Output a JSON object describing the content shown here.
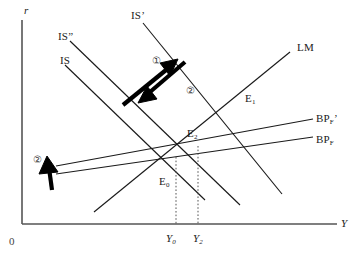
{
  "figure": {
    "type": "economics-diagram",
    "model": "IS-LM-BP open economy adjustment",
    "background_color": "#ffffff",
    "line_color": "#1a1a1a",
    "arrow_color": "#000000"
  },
  "axes": {
    "y_axis_label": "r",
    "x_axis_label": "Y",
    "origin_label": "0",
    "axis_color": "#555555"
  },
  "curves": [
    {
      "id": "IS",
      "label": "IS",
      "label_x": 60,
      "label_y": 55,
      "x1": 65,
      "y1": 65,
      "x2": 205,
      "y2": 200
    },
    {
      "id": "ISpp",
      "label": "IS”",
      "label_x": 58,
      "label_y": 31,
      "x1": 70,
      "y1": 41,
      "x2": 240,
      "y2": 205
    },
    {
      "id": "ISp",
      "label": "IS’",
      "label_x": 131,
      "label_y": 10,
      "x1": 143,
      "y1": 23,
      "x2": 282,
      "y2": 194
    },
    {
      "id": "LM",
      "label": "LM",
      "label_x": 297,
      "label_y": 42,
      "x1": 94,
      "y1": 212,
      "x2": 290,
      "y2": 52
    },
    {
      "id": "BPF",
      "label": "BP",
      "sublabel": "F",
      "prime": "",
      "label_x": 316,
      "label_y": 134,
      "x1": 56,
      "y1": 174,
      "x2": 313,
      "y2": 137
    },
    {
      "id": "BPFp",
      "label": "BP",
      "sublabel": "F",
      "prime": "’",
      "label_x": 316,
      "label_y": 113,
      "x1": 56,
      "y1": 166,
      "x2": 313,
      "y2": 119
    }
  ],
  "equilibria": [
    {
      "id": "E0",
      "label": "E",
      "sub": "0",
      "label_x": 159,
      "label_y": 176,
      "x": 176,
      "y": 157
    },
    {
      "id": "E2",
      "label": "E",
      "sub": "2",
      "label_x": 187,
      "label_y": 128,
      "x": 198,
      "y": 146
    },
    {
      "id": "E1",
      "label": "E",
      "sub": "1",
      "label_x": 245,
      "label_y": 93,
      "x": 248,
      "y": 105
    }
  ],
  "x_ticks": [
    {
      "id": "Y0",
      "label": "Y",
      "sub": "0",
      "label_x": 166,
      "label_y": 233,
      "x": 176,
      "y_top": 157,
      "y_bottom": 224
    },
    {
      "id": "Y2",
      "label": "Y",
      "sub": "2",
      "label_x": 193,
      "label_y": 233,
      "x": 198,
      "y_top": 146,
      "y_bottom": 224
    }
  ],
  "annotations": [
    {
      "id": "circ1",
      "label": "①",
      "x": 152,
      "y": 56,
      "note": "shift of IS outward to IS'"
    },
    {
      "id": "circ2_center",
      "label": "②",
      "x": 186,
      "y": 86,
      "note": "partial reversal IS' back to IS”"
    },
    {
      "id": "circ2_left",
      "label": "②",
      "x": 33,
      "y": 155,
      "note": "BP shifts up to BP'"
    }
  ],
  "bold_arrows": [
    {
      "id": "arrow-up-right",
      "direction": "up-right",
      "from_x": 123,
      "from_y": 105,
      "to_x": 175,
      "to_y": 62
    },
    {
      "id": "arrow-down-left",
      "direction": "down-left",
      "from_x": 185,
      "from_y": 62,
      "to_x": 143,
      "to_y": 100
    },
    {
      "id": "arrow-up-left",
      "direction": "up",
      "from_x": 55,
      "from_y": 188,
      "to_x": 48,
      "to_y": 159
    }
  ]
}
